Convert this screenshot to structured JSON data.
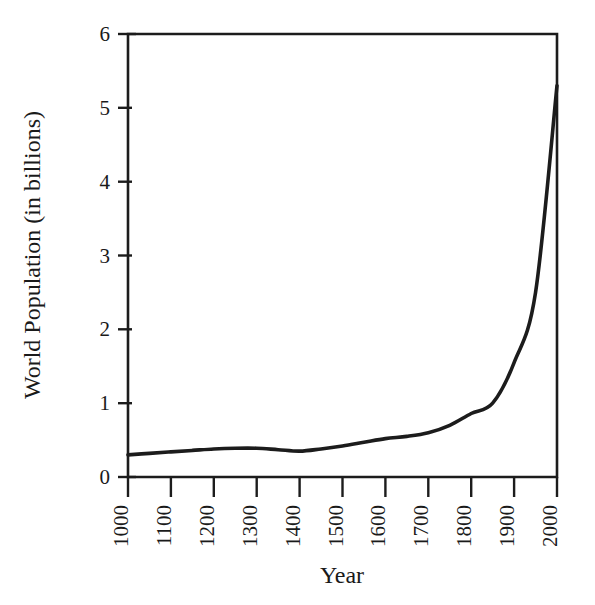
{
  "chart_data": {
    "type": "line",
    "title": "",
    "xlabel": "Year",
    "ylabel": "World Population (in billions)",
    "xlim": [
      1000,
      2000
    ],
    "ylim": [
      0,
      6
    ],
    "grid": false,
    "legend": null,
    "x_tick_labels": [
      "1000",
      "1100",
      "1200",
      "1300",
      "1400",
      "1500",
      "1600",
      "1700",
      "1800",
      "1900",
      "2000"
    ],
    "y_tick_labels": [
      "0",
      "1",
      "2",
      "3",
      "4",
      "5",
      "6"
    ],
    "x_ticks": [
      1000,
      1100,
      1200,
      1300,
      1400,
      1500,
      1600,
      1700,
      1800,
      1900,
      2000
    ],
    "y_ticks": [
      0,
      1,
      2,
      3,
      4,
      5,
      6
    ],
    "x_tick_rotation": 90,
    "series": [
      {
        "name": "World Population",
        "color": "#1c1c1c",
        "x": [
          1000,
          1050,
          1100,
          1150,
          1200,
          1250,
          1300,
          1350,
          1400,
          1450,
          1500,
          1550,
          1600,
          1650,
          1700,
          1750,
          1800,
          1850,
          1900,
          1950,
          2000
        ],
        "values": [
          0.3,
          0.32,
          0.34,
          0.36,
          0.38,
          0.39,
          0.39,
          0.37,
          0.35,
          0.38,
          0.42,
          0.47,
          0.52,
          0.55,
          0.6,
          0.7,
          0.86,
          1.0,
          1.55,
          2.5,
          5.3
        ]
      }
    ]
  },
  "axes": {
    "x_title": "Year",
    "y_title": "World Population (in billions)"
  }
}
